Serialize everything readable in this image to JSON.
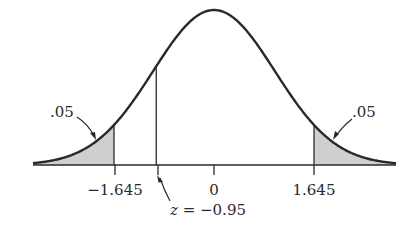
{
  "figure": {
    "type": "standard-normal-curve",
    "labels": {
      "left_tail_area": ".05",
      "right_tail_area": ".05",
      "tick_neg": "−1.645",
      "tick_zero": "0",
      "tick_pos": "1.645",
      "z_label_var": "z",
      "z_label_rest": " = −0.95"
    },
    "critical_values": [
      -1.645,
      1.645
    ],
    "tail_area": 0.05,
    "observed_z": -0.95,
    "colors": {
      "curve": "#2a2a2a",
      "shade": "#cfcfcf",
      "axis": "#2a2a2a"
    }
  }
}
